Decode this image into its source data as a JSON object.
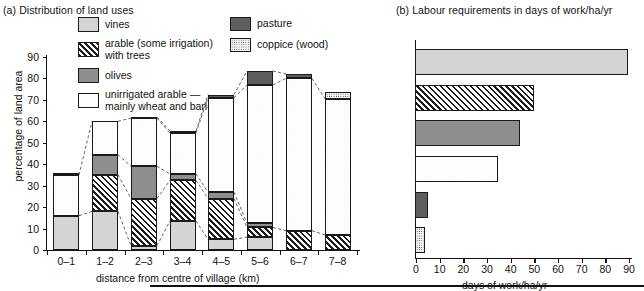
{
  "panel_a": {
    "title": "(a) Distribution of land uses",
    "ylabel": "percentage of land area",
    "xlabel": "distance from centre of village (km)",
    "yticks": [
      "0",
      "10",
      "20",
      "30",
      "40",
      "50",
      "60",
      "70",
      "80",
      "90"
    ],
    "xticks": [
      "0–1",
      "1–2",
      "2–3",
      "3–4",
      "4–5",
      "5–6",
      "6–7",
      "7–8"
    ]
  },
  "panel_b": {
    "title": "(b) Labour requirements in days of work/ha/yr",
    "xlabel": "days of work/ha/yr",
    "xticks": [
      "0",
      "10",
      "20",
      "30",
      "40",
      "50",
      "60",
      "70",
      "80",
      "90"
    ]
  },
  "legend": {
    "vines": "vines",
    "arable_line1": "arable (some irrigation)",
    "arable_line2": "with trees",
    "olives": "olives",
    "unirrigated_line1": "unirrigated arable —",
    "unirrigated_line2": "mainly wheat and barley",
    "pasture": "pasture",
    "coppice": "coppice (wood)"
  },
  "colors": {
    "vines": "#d4d4d4",
    "olives": "#8e8e8e",
    "pasture": "#5e5e5e",
    "arable": "#ffffff",
    "unirrigated": "#fdfdfd",
    "coppice": "#f2f2f2",
    "outline": "#1a1a1a"
  },
  "chart_data": [
    {
      "type": "bar",
      "id": "panel-a",
      "stacked": true,
      "title": "(a) Distribution of land uses",
      "xlabel": "distance from centre of village (km)",
      "ylabel": "percentage of land area",
      "ylim": [
        0,
        90
      ],
      "yticks": [
        0,
        10,
        20,
        30,
        40,
        50,
        60,
        70,
        80,
        90
      ],
      "grid": false,
      "legend_position": "top-centre",
      "categories": [
        "0–1",
        "1–2",
        "2–3",
        "3–4",
        "4–5",
        "5–6",
        "6–7",
        "7–8"
      ],
      "series": [
        {
          "name": "vines",
          "values": [
            16.0,
            18.0,
            2.0,
            13.5,
            5.0,
            6.0,
            0.0,
            0.0
          ]
        },
        {
          "name": "arable (some irrigation) with trees",
          "values": [
            0.0,
            17.0,
            22.0,
            19.0,
            19.0,
            4.5,
            9.0,
            7.0
          ]
        },
        {
          "name": "olives",
          "values": [
            0.0,
            9.5,
            15.0,
            3.0,
            3.0,
            2.0,
            0.0,
            0.0
          ]
        },
        {
          "name": "unirrigated arable — mainly wheat and barley",
          "values": [
            19.0,
            15.5,
            22.5,
            19.0,
            44.0,
            64.5,
            71.0,
            63.5
          ]
        },
        {
          "name": "pasture",
          "values": [
            0.0,
            0.0,
            0.5,
            1.0,
            1.5,
            6.5,
            2.0,
            0.0
          ]
        },
        {
          "name": "coppice (wood)",
          "values": [
            1.0,
            0.0,
            0.0,
            0.0,
            0.0,
            0.0,
            0.0,
            3.0
          ]
        }
      ],
      "totals": [
        36.0,
        60.0,
        62.0,
        55.0,
        72.5,
        83.5,
        82.0,
        77.5
      ],
      "notes": "Dashed tie-lines connect equivalent band boundaries across adjacent bars."
    },
    {
      "type": "bar",
      "id": "panel-b",
      "orientation": "horizontal",
      "title": "(b) Labour requirements in days of work/ha/yr",
      "xlabel": "days of work/ha/yr",
      "ylabel": "",
      "xlim": [
        0,
        90
      ],
      "xticks": [
        0,
        10,
        20,
        30,
        40,
        50,
        60,
        70,
        80,
        90
      ],
      "grid": false,
      "categories": [
        "vines",
        "arable (some irrigation) with trees",
        "olives",
        "unirrigated arable — mainly wheat and barley",
        "pasture",
        "coppice (wood)"
      ],
      "values": [
        89.5,
        50.0,
        44.0,
        34.5,
        5.0,
        4.0
      ]
    }
  ]
}
